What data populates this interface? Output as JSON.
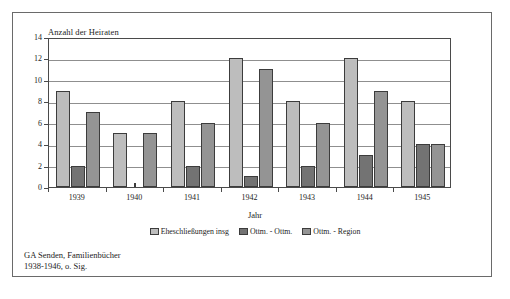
{
  "chart_data": {
    "type": "bar",
    "title": "",
    "xlabel": "Jahr",
    "ylabel": "Anzahl der Heiraten",
    "categories": [
      "1939",
      "1940",
      "1941",
      "1942",
      "1943",
      "1944",
      "1945"
    ],
    "ylim": [
      0,
      14
    ],
    "yticks": [
      0,
      2,
      4,
      6,
      8,
      10,
      12,
      14
    ],
    "grid": true,
    "legend_position": "bottom",
    "series": [
      {
        "name": "Eheschließungen insg",
        "color": "#bdbdbd",
        "values": [
          9,
          5,
          8,
          12,
          8,
          12,
          8
        ]
      },
      {
        "name": "Ottm. - Ottm.",
        "color": "#737373",
        "values": [
          2,
          0,
          2,
          1,
          2,
          3,
          4
        ]
      },
      {
        "name": "Ottm. - Region",
        "color": "#949494",
        "values": [
          7,
          5,
          6,
          11,
          6,
          9,
          4
        ]
      }
    ]
  },
  "source": {
    "line1": "GA Senden, Familienbücher",
    "line2": "1938-1946, o. Sig."
  }
}
